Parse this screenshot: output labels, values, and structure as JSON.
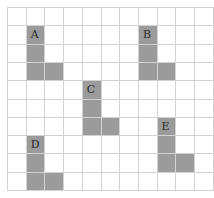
{
  "diagram": {
    "grid": {
      "origin_x": 7,
      "origin_y": 7,
      "col_width": 18.7,
      "row_height": 18.3,
      "cols": 11,
      "rows": 10,
      "line_color": "#d2d2d2"
    },
    "fill_color": "#9b9b9b",
    "shapes": [
      {
        "label": "A",
        "col": 1,
        "row": 1
      },
      {
        "label": "B",
        "col": 7,
        "row": 1
      },
      {
        "label": "C",
        "col": 4,
        "row": 4
      },
      {
        "label": "D",
        "col": 1,
        "row": 7
      },
      {
        "label": "E",
        "col": 8,
        "row": 6
      }
    ]
  }
}
